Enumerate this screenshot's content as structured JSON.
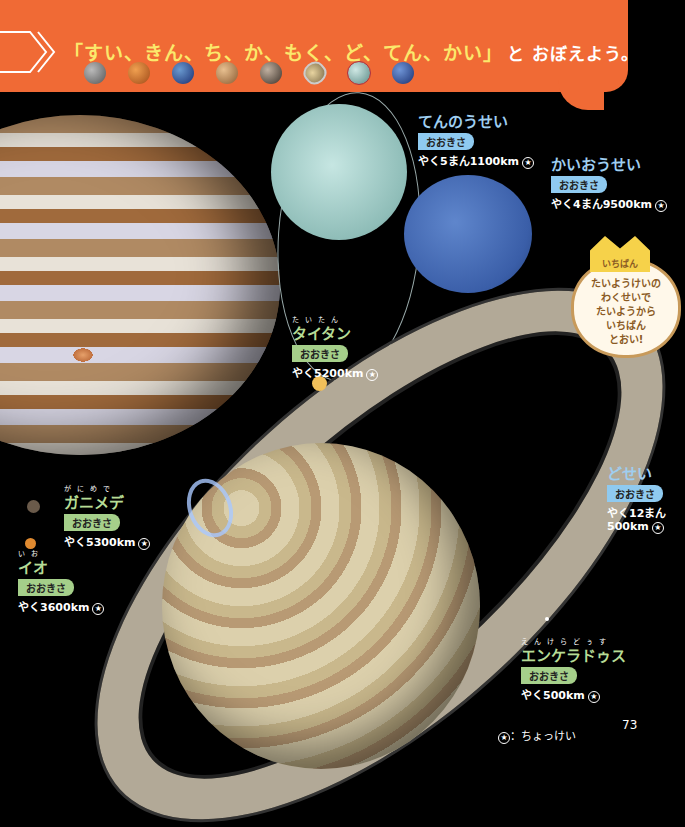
{
  "header": {
    "mnemonic": "「すい、きん、ち、か、もく、ど、てん、かい」",
    "mnemonic_tail": "と おぼえよう。",
    "mini_planets": [
      {
        "name": "mercury",
        "color": "#8a8a8a"
      },
      {
        "name": "venus",
        "color": "#d9853a"
      },
      {
        "name": "earth",
        "color": "#3a5fb0"
      },
      {
        "name": "mars",
        "color": "#c99a68"
      },
      {
        "name": "jupiter",
        "color": "#8a8078"
      },
      {
        "name": "saturn",
        "color": "#c8b48a"
      },
      {
        "name": "uranus",
        "color": "#9ecac4"
      },
      {
        "name": "neptune",
        "color": "#3a5ea8"
      }
    ]
  },
  "planets": {
    "uranus": {
      "name": "てんのうせい",
      "badge": "おおきさ",
      "size": "やく5まん1100",
      "unit": "km",
      "ruby_unit": "きろめーとる"
    },
    "neptune": {
      "name": "かいおうせい",
      "badge": "おおきさ",
      "size": "やく4まん9500",
      "unit": "km",
      "ruby_unit": "きろめーとる"
    },
    "saturn": {
      "name": "どせい",
      "badge": "おおきさ",
      "size_line1": "やく12まん",
      "size_line2": "500",
      "unit": "km",
      "ruby_unit": "きろめーとる"
    }
  },
  "moons": {
    "titan": {
      "ruby": "たいたん",
      "name": "タイタン",
      "badge": "おおきさ",
      "size": "やく5200",
      "unit": "km"
    },
    "ganymede": {
      "ruby": "がにめで",
      "name": "ガニメデ",
      "badge": "おおきさ",
      "size": "やく5300",
      "unit": "km"
    },
    "io": {
      "ruby": "いお",
      "name": "イオ",
      "badge": "おおきさ",
      "size": "やく3600",
      "unit": "km"
    },
    "enceladus": {
      "ruby": "えんけらどぅす",
      "name": "エンケラドゥス",
      "badge": "おおきさ",
      "size": "やく500",
      "unit": "km"
    }
  },
  "callout": {
    "crown_label": "いちばん",
    "lines": [
      "たいようけいの",
      "わくせいで",
      "たいようから",
      "いちばん",
      "とおい!"
    ]
  },
  "star_symbol": "★",
  "legend": "：ちょっけい",
  "page_number": "73"
}
